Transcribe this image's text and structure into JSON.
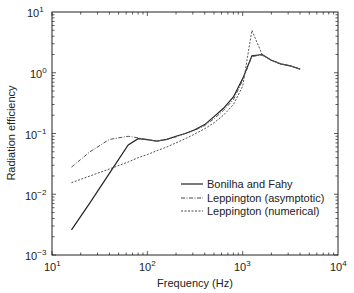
{
  "chart_data": {
    "type": "line",
    "title": "",
    "xlabel": "Frequency (Hz)",
    "ylabel": "Radiation efficiency",
    "xscale": "log",
    "yscale": "log",
    "xlim": [
      10,
      10000
    ],
    "ylim": [
      0.001,
      10
    ],
    "x_ticks": [
      "10^1",
      "10^2",
      "10^3",
      "10^4"
    ],
    "y_ticks": [
      "10^-3",
      "10^-2",
      "10^-1",
      "10^0",
      "10^1"
    ],
    "grid": false,
    "legend_position": "lower right",
    "series": [
      {
        "name": "Bonilha and Fahy",
        "style": "solid",
        "x": [
          16,
          25,
          40,
          63,
          80,
          100,
          125,
          160,
          200,
          250,
          315,
          400,
          500,
          630,
          800,
          1000,
          1250,
          1600,
          2000,
          2500,
          3150,
          4000
        ],
        "values": [
          0.0026,
          0.0072,
          0.022,
          0.065,
          0.082,
          0.079,
          0.075,
          0.08,
          0.09,
          0.1,
          0.115,
          0.14,
          0.19,
          0.26,
          0.4,
          0.8,
          1.9,
          2.0,
          1.6,
          1.4,
          1.3,
          1.15
        ]
      },
      {
        "name": "Leppington (asymptotic)",
        "style": "dashdot",
        "x": [
          16,
          25,
          40,
          63,
          80,
          100,
          125,
          160,
          200,
          250,
          315,
          400,
          500,
          630,
          800,
          1000,
          1250,
          1600,
          2000,
          2500,
          3150,
          4000
        ],
        "values": [
          0.028,
          0.05,
          0.08,
          0.09,
          0.085,
          0.079,
          0.075,
          0.08,
          0.088,
          0.1,
          0.113,
          0.135,
          0.175,
          0.24,
          0.36,
          0.75,
          1.85,
          1.95,
          1.6,
          1.4,
          1.3,
          1.15
        ]
      },
      {
        "name": "Leppington (numerical)",
        "style": "dashed",
        "x": [
          16,
          25,
          40,
          63,
          80,
          100,
          125,
          160,
          200,
          250,
          315,
          400,
          500,
          630,
          800,
          1000,
          1250,
          1600,
          2000,
          2500,
          3150,
          4000
        ],
        "values": [
          0.0155,
          0.02,
          0.026,
          0.034,
          0.04,
          0.045,
          0.052,
          0.06,
          0.07,
          0.082,
          0.098,
          0.12,
          0.15,
          0.2,
          0.3,
          0.6,
          5.0,
          2.0,
          1.6,
          1.4,
          1.3,
          1.15
        ]
      }
    ]
  },
  "axes": {
    "xlabel": "Frequency (Hz)",
    "ylabel": "Radiation efficiency",
    "x_tick_labels": [
      {
        "base": "10",
        "exp": "1"
      },
      {
        "base": "10",
        "exp": "2"
      },
      {
        "base": "10",
        "exp": "3"
      },
      {
        "base": "10",
        "exp": "4"
      }
    ],
    "y_tick_labels": [
      {
        "base": "10",
        "exp": "1"
      },
      {
        "base": "10",
        "exp": "0"
      },
      {
        "base": "10",
        "exp": "−1"
      },
      {
        "base": "10",
        "exp": "−2"
      },
      {
        "base": "10",
        "exp": "−3"
      }
    ]
  },
  "legend": {
    "items": [
      {
        "label": "Bonilha and Fahy",
        "style": "solid"
      },
      {
        "label": "Leppington (asymptotic)",
        "style": "dashdot"
      },
      {
        "label": "Leppington (numerical)",
        "style": "dashed"
      }
    ]
  }
}
